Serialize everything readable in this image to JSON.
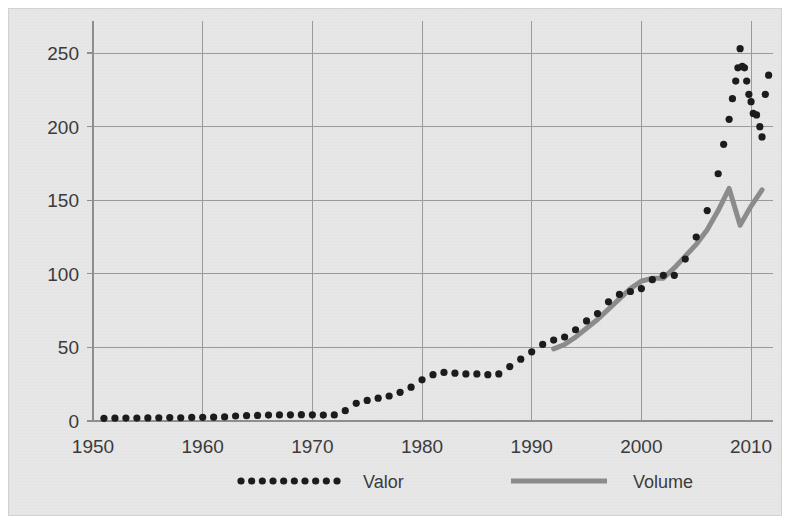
{
  "chart_data": {
    "type": "line",
    "title": "",
    "subtitle": "",
    "xlabel": "",
    "ylabel": "",
    "xlim": [
      1950,
      2012
    ],
    "ylim": [
      0,
      265
    ],
    "grid": true,
    "legend_position": "bottom",
    "xticks": [
      "1950",
      "1960",
      "1970",
      "1980",
      "1990",
      "2000",
      "2010"
    ],
    "xtick_values": [
      1950,
      1960,
      1970,
      1980,
      1990,
      2000,
      2010
    ],
    "yticks": [
      "0",
      "50",
      "100",
      "150",
      "200",
      "250"
    ],
    "ytick_values": [
      0,
      50,
      100,
      150,
      200,
      250
    ],
    "series": [
      {
        "name": "Valor",
        "style": "dotted",
        "color": "#1c1c1c",
        "marker": "circle",
        "x": [
          1951,
          1952,
          1953,
          1954,
          1955,
          1956,
          1957,
          1958,
          1959,
          1960,
          1961,
          1962,
          1963,
          1964,
          1965,
          1966,
          1967,
          1968,
          1969,
          1970,
          1971,
          1972,
          1973,
          1974,
          1975,
          1976,
          1977,
          1978,
          1979,
          1980,
          1981,
          1982,
          1983,
          1984,
          1985,
          1986,
          1987,
          1988,
          1989,
          1990,
          1991,
          1992,
          1993,
          1994,
          1995,
          1996,
          1997,
          1998,
          1999,
          2000,
          2001,
          2002,
          2003,
          2004,
          2005,
          2006,
          2007,
          2007.5,
          2008,
          2008.3,
          2008.6,
          2008.8,
          2009,
          2009.2,
          2009.4,
          2009.6,
          2009.8,
          2010,
          2010.2,
          2010.5,
          2010.8,
          2011,
          2011.3,
          2011.6
        ],
        "values": [
          1.8,
          1.9,
          2.0,
          2.0,
          2.1,
          2.2,
          2.3,
          2.2,
          2.4,
          2.5,
          2.6,
          2.8,
          3.4,
          3.6,
          3.8,
          4.0,
          4.1,
          4.2,
          4.3,
          4.2,
          4.0,
          4.1,
          7.0,
          12.0,
          14.0,
          15.5,
          17.0,
          19.5,
          23.0,
          28.0,
          31.5,
          33.0,
          32.5,
          32.0,
          32.0,
          31.5,
          32.0,
          37.0,
          42.0,
          47.0,
          52.0,
          55.0,
          57.0,
          62.0,
          68.0,
          73.0,
          81.0,
          86.0,
          88.0,
          90.0,
          96.0,
          99.0,
          99.0,
          110.0,
          125.0,
          143.0,
          168.0,
          188.0,
          205.0,
          219.0,
          231.0,
          240.0,
          253.0,
          241.0,
          240.0,
          231.0,
          222.0,
          217.0,
          209.0,
          208.0,
          200.0,
          193.0,
          222.0,
          235.0
        ]
      },
      {
        "name": "Volume",
        "style": "solid",
        "color": "#8b8b8b",
        "marker": "none",
        "x": [
          1992,
          1993,
          1994,
          1995,
          1996,
          1997,
          1998,
          1999,
          2000,
          2001,
          2002,
          2003,
          2004,
          2005,
          2006,
          2007,
          2008,
          2009,
          2010,
          2011
        ],
        "values": [
          49,
          52,
          57,
          63,
          69,
          76,
          83,
          90,
          95,
          97,
          97,
          104,
          112,
          120,
          130,
          143,
          158,
          133,
          146,
          157
        ]
      }
    ],
    "legend": [
      {
        "label": "Valor",
        "style": "dotted",
        "color": "#1c1c1c"
      },
      {
        "label": "Volume",
        "style": "solid",
        "color": "#8b8b8b"
      }
    ]
  },
  "figure": {
    "background_color": "#e7e7e7",
    "page_color": "#ffffff",
    "grid_color": "#9a9a9a",
    "text_color": "#3b3b3b"
  }
}
